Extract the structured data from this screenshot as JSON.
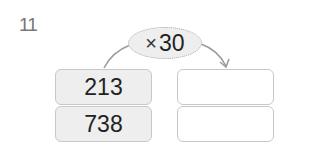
{
  "question": {
    "number": "11"
  },
  "operation": {
    "symbol": "×",
    "operand": "30"
  },
  "inputs": [
    {
      "value": "213"
    },
    {
      "value": "738"
    }
  ],
  "outputs": [
    {
      "value": ""
    },
    {
      "value": ""
    }
  ],
  "colors": {
    "input_fill": "#eeeeee",
    "border": "#c8c8c8",
    "text": "#222222",
    "arrow": "#999999"
  }
}
